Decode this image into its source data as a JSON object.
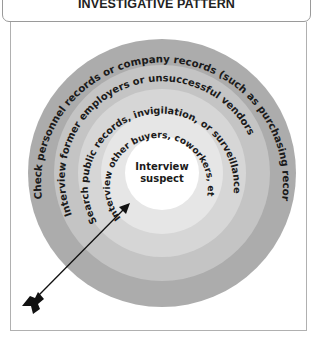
{
  "title": "INVESTIGATIVE PATTERN",
  "diagram": {
    "type": "concentric-target",
    "center": {
      "line1": "Interview",
      "line2": "suspect"
    },
    "rings": [
      {
        "level": 1,
        "label": "Interview other buyers, coworkers, etc.",
        "color": "#e6e6e6"
      },
      {
        "level": 2,
        "label": "Search public records, invigilation, or surveillance",
        "color": "#d6d6d6"
      },
      {
        "level": 3,
        "label": "Interview former employers or unsuccessful vendors",
        "color": "#c4c4c4"
      },
      {
        "level": 4,
        "label": "Check personnel records or company records (such as purchasing records)",
        "color": "#acacac"
      }
    ],
    "center_color": "#ffffff",
    "arrow": {
      "direction": "toward-center",
      "color": "#111111"
    }
  }
}
